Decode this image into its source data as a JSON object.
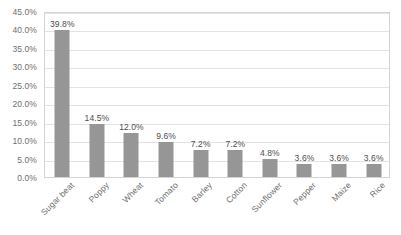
{
  "chart_data": {
    "type": "bar",
    "title": "",
    "subtitle": "",
    "xlabel": "",
    "ylabel": "",
    "categories": [
      "Sugar beat",
      "Poppy",
      "Wheat",
      "Tomato",
      "Barley",
      "Cotton",
      "Sunflower",
      "Pepper",
      "Maize",
      "Rice"
    ],
    "values": [
      39.8,
      14.5,
      12.0,
      9.6,
      7.2,
      7.2,
      4.8,
      3.6,
      3.6,
      3.6
    ],
    "data_labels": [
      "39.8%",
      "14.5%",
      "12.0%",
      "9.6%",
      "7.2%",
      "7.2%",
      "4.8%",
      "3.6%",
      "3.6%",
      "3.6%"
    ],
    "ylim": [
      0,
      45
    ],
    "ytick_values": [
      0,
      5,
      10,
      15,
      20,
      25,
      30,
      35,
      40,
      45
    ],
    "ytick_labels": [
      "0.0%",
      "5.0%",
      "10.0%",
      "15.0%",
      "20.0%",
      "25.0%",
      "30.0%",
      "35.0%",
      "40.0%",
      "45.0%"
    ],
    "grid": true,
    "grid_axis": "y",
    "legend": false,
    "legend_position": "none",
    "series": [
      {
        "name": "",
        "values": [
          39.8,
          14.5,
          12.0,
          9.6,
          7.2,
          7.2,
          4.8,
          3.6,
          3.6,
          3.6
        ]
      }
    ],
    "colors": {
      "bar": "#969696",
      "gridline": "#e3e3e3",
      "plot_border": "#d4d4d4",
      "axis_text": "#6e6e6e",
      "data_label_text": "#4d4d4d",
      "background": "#ffffff"
    }
  }
}
